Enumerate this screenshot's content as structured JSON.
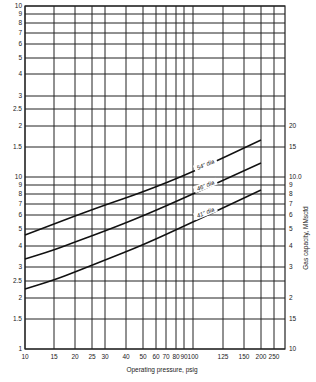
{
  "chart_data": {
    "type": "line",
    "title": "",
    "xlabel": "Operating pressure, psig",
    "ylabel_right": "Gas capacity, MMscfd",
    "x_scale": "log",
    "y_scale": "log",
    "grid": true,
    "xlim": [
      10,
      250
    ],
    "x_ticks": [
      {
        "label": "10",
        "value": 10,
        "px": 25
      },
      {
        "label": "15",
        "value": 15,
        "px": 54
      },
      {
        "label": "20",
        "value": 20,
        "px": 75
      },
      {
        "label": "25",
        "value": 25,
        "px": 92
      },
      {
        "label": "30",
        "value": 30,
        "px": 105
      },
      {
        "label": "40",
        "value": 40,
        "px": 126
      },
      {
        "label": "50",
        "value": 50,
        "px": 143
      },
      {
        "label": "60",
        "value": 60,
        "px": 156
      },
      {
        "label": "70",
        "value": 70,
        "px": 166
      },
      {
        "label": "80",
        "value": 80,
        "px": 176
      },
      {
        "label": "90",
        "value": 90,
        "px": 184
      },
      {
        "label": "100",
        "value": 100,
        "px": 193
      },
      {
        "label": "125",
        "value": 125,
        "px": 223
      },
      {
        "label": "150",
        "value": 150,
        "px": 244
      },
      {
        "label": "200",
        "value": 200,
        "px": 261
      },
      {
        "label": "250",
        "value": 250,
        "px": 274
      }
    ],
    "y_ticks_left": [
      {
        "label": "10",
        "py": 6
      },
      {
        "label": "9",
        "py": 14
      },
      {
        "label": "8",
        "py": 23
      },
      {
        "label": "7",
        "py": 33
      },
      {
        "label": "6",
        "py": 44
      },
      {
        "label": "5",
        "py": 58
      },
      {
        "label": "4",
        "py": 74
      },
      {
        "label": "3",
        "py": 96
      },
      {
        "label": "2.5",
        "py": 109
      },
      {
        "label": "2",
        "py": 126
      },
      {
        "label": "1.5",
        "py": 147
      },
      {
        "label": "10",
        "py": 177
      },
      {
        "label": "9",
        "py": 185
      },
      {
        "label": "8",
        "py": 194
      },
      {
        "label": "7",
        "py": 204
      },
      {
        "label": "6",
        "py": 215
      },
      {
        "label": "5",
        "py": 229
      },
      {
        "label": "4",
        "py": 246
      },
      {
        "label": "3",
        "py": 267
      },
      {
        "label": "2.5",
        "py": 281
      },
      {
        "label": "2",
        "py": 298
      },
      {
        "label": "1.5",
        "py": 319
      },
      {
        "label": "1",
        "py": 349
      }
    ],
    "y_ticks_right": [
      {
        "label": "20",
        "py": 126
      },
      {
        "label": "15",
        "py": 147
      },
      {
        "label": "10.0",
        "py": 177
      },
      {
        "label": "9",
        "py": 185
      },
      {
        "label": "8",
        "py": 194
      },
      {
        "label": "7",
        "py": 204
      },
      {
        "label": "6",
        "py": 215
      },
      {
        "label": "5",
        "py": 229
      },
      {
        "label": "4",
        "py": 246
      },
      {
        "label": "3",
        "py": 267
      },
      {
        "label": "2",
        "py": 298
      },
      {
        "label": "15",
        "py": 319
      },
      {
        "label": "10",
        "py": 349
      }
    ],
    "x": [
      10,
      15,
      20,
      30,
      50,
      100,
      200
    ],
    "series": [
      {
        "name": "54\" dia",
        "label": "54\" dia",
        "values": [
          4.6,
          5.2,
          5.7,
          6.5,
          7.9,
          10.6,
          16.5
        ],
        "points_px": [
          [
            25,
            235
          ],
          [
            54,
            224
          ],
          [
            75,
            216
          ],
          [
            105,
            205
          ],
          [
            143,
            192
          ],
          [
            193,
            172
          ],
          [
            261,
            140
          ]
        ],
        "label_px": [
          206,
          166
        ],
        "label_angle": -22
      },
      {
        "name": "46\" dia",
        "label": "46\" dia",
        "values": [
          3.3,
          3.7,
          4.1,
          4.8,
          5.9,
          7.8,
          12.0
        ],
        "points_px": [
          [
            25,
            259
          ],
          [
            54,
            250
          ],
          [
            75,
            242
          ],
          [
            105,
            231
          ],
          [
            143,
            216
          ],
          [
            193,
            194
          ],
          [
            261,
            163
          ]
        ],
        "label_px": [
          206,
          187
        ],
        "label_angle": -22
      },
      {
        "name": "41\" dia",
        "label": "41\" dia",
        "values": [
          2.25,
          2.55,
          2.8,
          3.25,
          4.1,
          5.3,
          8.5
        ],
        "points_px": [
          [
            25,
            289
          ],
          [
            54,
            280
          ],
          [
            75,
            272
          ],
          [
            105,
            260
          ],
          [
            143,
            245
          ],
          [
            193,
            222
          ],
          [
            261,
            190
          ]
        ],
        "label_px": [
          206,
          214
        ],
        "label_angle": -22
      }
    ],
    "plot_px": {
      "left": 25,
      "right": 285,
      "top": 6,
      "bottom": 349
    }
  }
}
